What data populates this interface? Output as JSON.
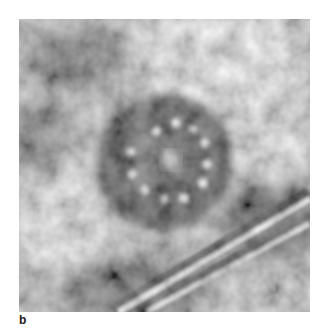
{
  "figure": {
    "panel_label": "b",
    "colors": {
      "background": "#ffffff",
      "dark": "#2e2e2e",
      "mid": "#8a8a8a",
      "light": "#e6e6e6"
    },
    "ring": {
      "center": [
        145,
        143
      ],
      "outer_radius": 68,
      "dot_radius": 45,
      "dot_count": 11
    }
  }
}
